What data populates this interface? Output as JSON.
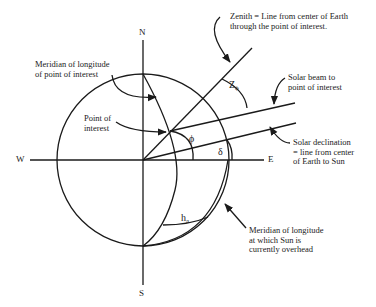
{
  "diagram": {
    "directions": {
      "north": "N",
      "south": "S",
      "west": "W",
      "east": "E"
    },
    "annotations": {
      "zenith": {
        "line1": "Zenith = Line from center of Earth",
        "line2": "through the point of interest."
      },
      "meridian_point": {
        "line1": "Meridian of longitude",
        "line2": "of point of interest"
      },
      "point_of_interest": {
        "line1": "Point of",
        "line2": "interest"
      },
      "solar_beam": {
        "line1": "Solar beam to",
        "line2": "point of interest"
      },
      "solar_declination": {
        "line1": "Solar declination",
        "line2": "= line from center",
        "line3": "of Earth to Sun"
      },
      "meridian_sun": {
        "line1": "Meridian of longitude",
        "line2": "at which Sun is",
        "line3": "currently overhead"
      }
    },
    "angles": {
      "zenith_angle": {
        "symbol": "Z",
        "subscript": "ϕ"
      },
      "latitude": {
        "symbol": "ϕ"
      },
      "declination": {
        "symbol": "δ"
      },
      "hour_angle": {
        "symbol": "h",
        "subscript": "a"
      }
    },
    "colors": {
      "stroke": "#1a1a1a",
      "text": "#222222",
      "background": "#ffffff"
    }
  }
}
